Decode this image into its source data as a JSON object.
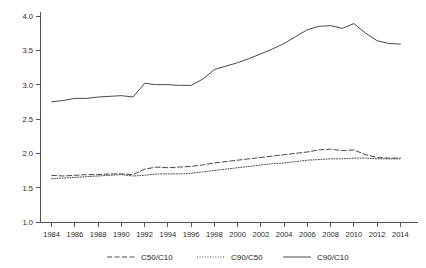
{
  "chart_data": {
    "type": "line",
    "title": "",
    "subtitle": "",
    "xlabel": "",
    "ylabel": "",
    "xlim": [
      1983,
      2015
    ],
    "ylim": [
      1.0,
      4.0
    ],
    "grid": false,
    "legend_position": "bottom",
    "x": [
      1984,
      1985,
      1986,
      1987,
      1988,
      1989,
      1990,
      1991,
      1992,
      1993,
      1994,
      1995,
      1996,
      1997,
      1998,
      1999,
      2000,
      2001,
      2002,
      2003,
      2004,
      2005,
      2006,
      2007,
      2008,
      2009,
      2010,
      2011,
      2012,
      2013,
      2014
    ],
    "xticks": [
      1984,
      1986,
      1988,
      1990,
      1992,
      1994,
      1996,
      1998,
      2000,
      2002,
      2004,
      2006,
      2008,
      2010,
      2012,
      2014
    ],
    "xticklabels": [
      "1984",
      "1986",
      "1988",
      "1990",
      "1992",
      "1994",
      "1996",
      "1998",
      "2000",
      "2002",
      "2004",
      "2006",
      "2008",
      "2010",
      "2012",
      "2014"
    ],
    "yticks": [
      1.0,
      1.5,
      2.0,
      2.5,
      3.0,
      3.5,
      4.0
    ],
    "yticklabels": [
      "1.0",
      "1.5",
      "2.0",
      "2.5",
      "3.0",
      "3.5",
      "4.0"
    ],
    "series": [
      {
        "name": "C50/C10",
        "style": "dashed",
        "color": "#4a4a4a",
        "values": [
          1.68,
          1.67,
          1.68,
          1.69,
          1.69,
          1.7,
          1.7,
          1.69,
          1.77,
          1.8,
          1.79,
          1.8,
          1.81,
          1.83,
          1.86,
          1.88,
          1.9,
          1.92,
          1.94,
          1.96,
          1.98,
          2.0,
          2.02,
          2.05,
          2.06,
          2.04,
          2.05,
          1.98,
          1.94,
          1.93,
          1.93
        ]
      },
      {
        "name": "C90/C50",
        "style": "dotted",
        "color": "#4a4a4a",
        "values": [
          1.63,
          1.64,
          1.65,
          1.66,
          1.67,
          1.68,
          1.69,
          1.67,
          1.68,
          1.7,
          1.7,
          1.7,
          1.71,
          1.73,
          1.75,
          1.77,
          1.79,
          1.81,
          1.83,
          1.85,
          1.86,
          1.88,
          1.9,
          1.91,
          1.92,
          1.92,
          1.93,
          1.93,
          1.92,
          1.92,
          1.92
        ]
      },
      {
        "name": "C90/C10",
        "style": "solid",
        "color": "#4a4a4a",
        "values": [
          2.75,
          2.77,
          2.8,
          2.8,
          2.82,
          2.83,
          2.84,
          2.82,
          3.02,
          3.0,
          3.0,
          2.99,
          2.99,
          3.08,
          3.22,
          3.27,
          3.32,
          3.38,
          3.45,
          3.52,
          3.6,
          3.7,
          3.8,
          3.85,
          3.86,
          3.82,
          3.89,
          3.75,
          3.64,
          3.6,
          3.59
        ]
      }
    ],
    "legend": [
      {
        "label": "C50/C10",
        "style": "dashed"
      },
      {
        "label": "C90/C50",
        "style": "dotted"
      },
      {
        "label": "C90/C10",
        "style": "solid"
      }
    ]
  },
  "layout": {
    "plot_left": 40,
    "plot_right": 412,
    "plot_top": 16,
    "plot_bottom": 222,
    "legend_y": 257
  }
}
